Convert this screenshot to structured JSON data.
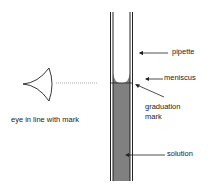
{
  "diagram": {
    "labels": {
      "pipette": "pipette",
      "meniscus": "meniscus",
      "graduation_mark_line1": "graduation",
      "graduation_mark_line2": "mark",
      "solution": "solution",
      "eye": "eye in line with mark"
    },
    "colors": {
      "line": "#222222",
      "solution_fill": "#808080",
      "dotted": "#888888",
      "background": "#ffffff"
    }
  }
}
